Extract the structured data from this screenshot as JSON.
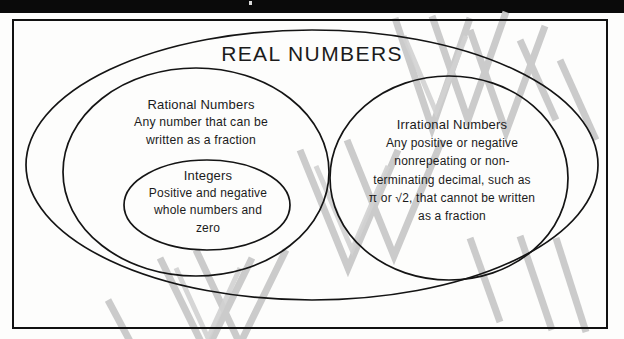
{
  "document": {
    "kind": "venn-diagram",
    "subject": "The Real Number System",
    "header_bar_color": "#0a0a0a",
    "frame_color": "#111111",
    "ink_color": "#1b1b1b",
    "paper_color": "#fdfdfc",
    "watermark_color": "#c9c9c9",
    "watermark_text": "PREVIEW"
  },
  "diagram": {
    "title": "REAL NUMBERS",
    "sets": [
      {
        "id": "real-numbers",
        "heading": "REAL NUMBERS",
        "body_lines": [],
        "level": 0
      },
      {
        "id": "rational-numbers",
        "heading": "Rational Numbers",
        "body_lines": [
          "Any number that can be",
          "written as a fraction"
        ],
        "level": 1
      },
      {
        "id": "integers",
        "heading": "Integers",
        "body_lines": [
          "Positive and negative",
          "whole numbers and",
          "zero"
        ],
        "level": 2
      },
      {
        "id": "irrational-numbers",
        "heading": "Irrational Numbers",
        "body_lines": [
          "Any positive or negative",
          "nonrepeating or non-",
          "terminating decimal, such as",
          "π or √2, that cannot be written",
          "as a fraction"
        ],
        "level": 1
      }
    ],
    "rational": {
      "heading": "Rational Numbers",
      "line1": "Any number that can be",
      "line2": "written as a fraction"
    },
    "integers": {
      "heading": "Integers",
      "line1": "Positive and negative",
      "line2": "whole numbers and",
      "line3": "zero"
    },
    "irrational": {
      "heading": "Irrational Numbers",
      "line1": "Any positive or negative",
      "line2": "nonrepeating or non-",
      "line3": "terminating decimal, such as",
      "line4": "π or √2, that cannot be written",
      "line5": "as a fraction"
    }
  }
}
